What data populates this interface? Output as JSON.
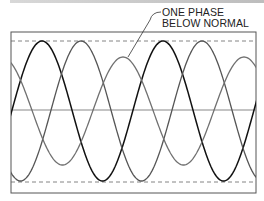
{
  "diagram": {
    "annotation": {
      "line1": "ONE PHASE",
      "line2": "BELOW NORMAL"
    },
    "colors": {
      "frame": "#555555",
      "dashed_limits": "#666666",
      "center_line": "#888888",
      "phase_a": "#111111",
      "phase_b": "#555555",
      "phase_c_reduced": "#6e6e6e",
      "top_bar": "#c8c8c8"
    },
    "series": [
      {
        "name": "phase-a",
        "amplitude": "normal",
        "peak_x": [
          42,
          162
        ]
      },
      {
        "name": "phase-b",
        "amplitude": "normal",
        "peak_x": [
          78,
          205
        ]
      },
      {
        "name": "phase-c",
        "amplitude": "below normal",
        "peak_x": [
          123,
          245
        ]
      }
    ]
  }
}
